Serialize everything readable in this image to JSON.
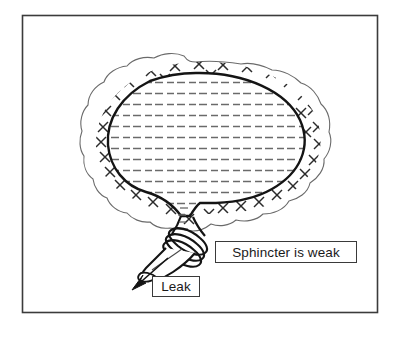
{
  "figure": {
    "frame": {
      "border_color": "#3b3b3b",
      "background": "#ffffff",
      "x": 22,
      "y": 15,
      "width": 356,
      "height": 298
    },
    "colors": {
      "outline": "#1a1a1a",
      "wall_outline": "#4a4a4a",
      "hatch_mark": "#2b2b2b",
      "fluid_dash": "#5a5a5a",
      "label_border": "#3a3a3a",
      "label_text": "#1a1a1a",
      "arrow": "#1a1a1a",
      "page_background": "#ffffff"
    },
    "parts": [
      {
        "name": "bladder-wall",
        "description": "wavy outer muscle layer filled with X hatch marks"
      },
      {
        "name": "bladder-lumen",
        "description": "inner bladder cavity filled with horizontal dashed lines representing urine"
      },
      {
        "name": "bladder-neck",
        "description": "tapering funnel between bladder body and urethra"
      },
      {
        "name": "sphincter-bands",
        "description": "three parallel bands wrapped around the urethra"
      },
      {
        "name": "urethra",
        "description": "tube leading down-left from the sphincter"
      },
      {
        "name": "leak-arrow",
        "description": "arrow pointing down-left out of the urethra opening"
      }
    ],
    "hatch_symbol": "×",
    "hatch_count": 42,
    "fluid_rows": 13
  },
  "labels": {
    "sphincter": "Sphincter is weak",
    "leak": "Leak"
  }
}
